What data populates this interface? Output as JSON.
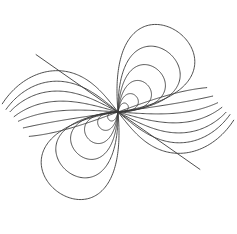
{
  "figure": {
    "kind": "dipole-field-lines",
    "width": 237,
    "height": 234,
    "background_color": "#ffffff",
    "stroke_color": "#3a3a3a",
    "stroke_width": 0.9,
    "node": {
      "x": 118.0,
      "y": 112.0
    },
    "axis_angle_deg": 38.0,
    "symmetry": "180-degree rotational about node"
  },
  "chart_data": {
    "type": "line",
    "xlabel": "",
    "ylabel": "",
    "grid": false,
    "legend": "none",
    "xlim": [
      0,
      237
    ],
    "ylim": [
      0,
      234
    ],
    "node": {
      "x": 118.0,
      "y": 112.0
    },
    "axis_angle_deg": 38.0,
    "closed_loops_upper": [
      {
        "name": "loop-u1",
        "reach": 12.0,
        "width_ratio": 0.86,
        "tilt_deg": 38.0
      },
      {
        "name": "loop-u2",
        "reach": 24.0,
        "width_ratio": 0.86,
        "tilt_deg": 40.0
      },
      {
        "name": "loop-u3",
        "reach": 40.0,
        "width_ratio": 0.88,
        "tilt_deg": 42.0
      },
      {
        "name": "loop-u4",
        "reach": 58.0,
        "width_ratio": 0.9,
        "tilt_deg": 45.0
      },
      {
        "name": "loop-u5",
        "reach": 78.0,
        "width_ratio": 0.92,
        "tilt_deg": 48.0
      },
      {
        "name": "loop-u6",
        "reach": 100.0,
        "width_ratio": 0.94,
        "tilt_deg": 52.0
      }
    ],
    "closed_loops_lower": [
      {
        "name": "loop-l1",
        "reach": 12.0,
        "width_ratio": 0.86,
        "tilt_deg": 218.0
      },
      {
        "name": "loop-l2",
        "reach": 24.0,
        "width_ratio": 0.86,
        "tilt_deg": 220.0
      },
      {
        "name": "loop-l3",
        "reach": 40.0,
        "width_ratio": 0.88,
        "tilt_deg": 222.0
      },
      {
        "name": "loop-l4",
        "reach": 58.0,
        "width_ratio": 0.9,
        "tilt_deg": 225.0
      },
      {
        "name": "loop-l5",
        "reach": 78.0,
        "width_ratio": 0.92,
        "tilt_deg": 228.0
      },
      {
        "name": "loop-l6",
        "reach": 100.0,
        "width_ratio": 0.94,
        "tilt_deg": 232.0
      }
    ],
    "open_curves_left": [
      {
        "name": "open-lt1",
        "start_deg": 128.0,
        "curvature": 0.62,
        "length": 116.0
      },
      {
        "name": "open-lt2",
        "start_deg": 140.0,
        "curvature": 0.5,
        "length": 112.0
      },
      {
        "name": "open-lt3",
        "start_deg": 152.0,
        "curvature": 0.36,
        "length": 108.0
      },
      {
        "name": "open-lt4",
        "start_deg": 164.0,
        "curvature": 0.24,
        "length": 104.0
      },
      {
        "name": "open-lt5",
        "start_deg": 176.0,
        "curvature": 0.12,
        "length": 100.0
      },
      {
        "name": "open-lt6",
        "start_deg": 188.0,
        "curvature": 0.02,
        "length": 96.0
      },
      {
        "name": "open-lt7",
        "start_deg": 200.0,
        "curvature": -0.06,
        "length": 92.0
      }
    ],
    "open_curves_right": [
      {
        "name": "open-rt1",
        "start_deg": 308.0,
        "curvature": 0.62,
        "length": 116.0
      },
      {
        "name": "open-rt2",
        "start_deg": 320.0,
        "curvature": 0.5,
        "length": 112.0
      },
      {
        "name": "open-rt3",
        "start_deg": 332.0,
        "curvature": 0.36,
        "length": 108.0
      },
      {
        "name": "open-rt4",
        "start_deg": 344.0,
        "curvature": 0.24,
        "length": 104.0
      },
      {
        "name": "open-rt5",
        "start_deg": 356.0,
        "curvature": 0.12,
        "length": 100.0
      },
      {
        "name": "open-rt6",
        "start_deg": 8.0,
        "curvature": 0.02,
        "length": 96.0
      },
      {
        "name": "open-rt7",
        "start_deg": 20.0,
        "curvature": -0.06,
        "length": 92.0
      }
    ],
    "straight_rays": [
      {
        "name": "ray-upper-left",
        "angle_deg": 145.0,
        "length": 100.0
      },
      {
        "name": "ray-lower-right",
        "angle_deg": 325.0,
        "length": 100.0
      }
    ]
  }
}
